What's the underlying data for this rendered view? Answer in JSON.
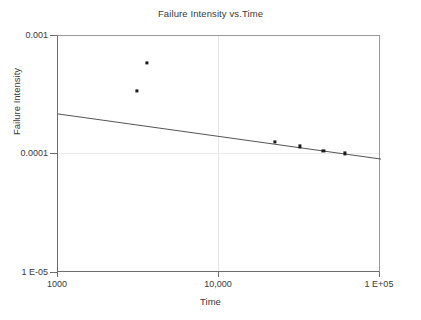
{
  "chart_data": {
    "type": "scatter",
    "title": "Failure Intensity vs.Time",
    "xlabel": "Time",
    "ylabel": "Failure Intensity",
    "xscale": "log",
    "yscale": "log",
    "xlim": [
      1000,
      100000
    ],
    "ylim": [
      1e-05,
      0.001
    ],
    "grid": true,
    "legend": null,
    "xticks": [
      {
        "value": 1000,
        "label": "1000"
      },
      {
        "value": 10000,
        "label": "10,000"
      },
      {
        "value": 100000,
        "label": "1 E+05"
      }
    ],
    "yticks": [
      {
        "value": 0.001,
        "label": "0.001"
      },
      {
        "value": 0.0001,
        "label": "0.0001"
      },
      {
        "value": 1e-05,
        "label": "1 E-05"
      }
    ],
    "series": [
      {
        "name": "Failure Intensity",
        "marker": "square",
        "color": "#1a1a1a",
        "points": [
          {
            "x": 3080,
            "y": 0.000345
          },
          {
            "x": 3560,
            "y": 0.00059
          },
          {
            "x": 22000,
            "y": 0.000127
          },
          {
            "x": 31500,
            "y": 0.000117
          },
          {
            "x": 44000,
            "y": 0.000108
          },
          {
            "x": 60000,
            "y": 0.000102
          }
        ]
      },
      {
        "name": "Trend line",
        "type": "line",
        "color": "#555555",
        "points": [
          {
            "x": 1000,
            "y": 0.00022
          },
          {
            "x": 100000,
            "y": 9.15e-05
          }
        ]
      }
    ]
  }
}
